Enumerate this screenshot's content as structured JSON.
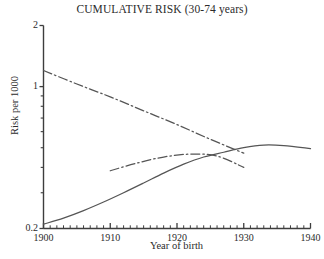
{
  "chart_data": {
    "type": "line",
    "title": "CUMULATIVE RISK (30-74 years)",
    "xlabel": "Year of birth",
    "ylabel": "Risk per 1000",
    "yscale": "log",
    "ylim": [
      0.2,
      2
    ],
    "xlim": [
      1900,
      1940
    ],
    "grid": false,
    "legend": "none",
    "ytick_labels": [
      "2",
      "1",
      "0.2"
    ],
    "ytick_values": [
      2,
      1,
      0.2
    ],
    "xtick_labels": [
      "1900",
      "1910",
      "1920",
      "1930",
      "1940"
    ],
    "xtick_values": [
      1900,
      1910,
      1920,
      1930,
      1940
    ],
    "x_minor_tick_step": 1,
    "series": [
      {
        "name": "declining-dashdot",
        "style": "dash-dot",
        "color": "#555555",
        "x": [
          1900,
          1905,
          1910,
          1915,
          1920,
          1925,
          1930
        ],
        "values": [
          1.2,
          1.03,
          0.89,
          0.76,
          0.65,
          0.55,
          0.47
        ]
      },
      {
        "name": "rising-solid",
        "style": "solid",
        "color": "#555555",
        "x": [
          1900,
          1903,
          1906,
          1909,
          1912,
          1915,
          1918,
          1921,
          1924,
          1927,
          1930,
          1933,
          1936,
          1940
        ],
        "values": [
          0.21,
          0.225,
          0.245,
          0.27,
          0.3,
          0.335,
          0.375,
          0.415,
          0.45,
          0.475,
          0.5,
          0.515,
          0.512,
          0.495
        ]
      },
      {
        "name": "middle-dashdot",
        "style": "dash-dot",
        "color": "#555555",
        "x": [
          1910,
          1914,
          1918,
          1922,
          1926,
          1930
        ],
        "values": [
          0.385,
          0.42,
          0.45,
          0.465,
          0.455,
          0.4
        ]
      }
    ]
  }
}
